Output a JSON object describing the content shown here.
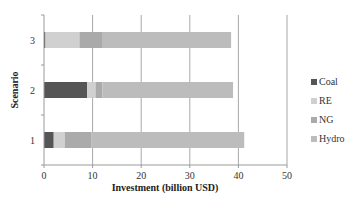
{
  "chart_data": {
    "type": "bar",
    "orientation": "horizontal",
    "stacked": true,
    "title": "",
    "xlabel": "Investment (billion USD)",
    "ylabel": "Scenario",
    "xlim": [
      0,
      50
    ],
    "xticks": [
      0,
      10,
      20,
      30,
      40,
      50
    ],
    "grid": "vertical",
    "categories": [
      "1",
      "2",
      "3"
    ],
    "series": [
      {
        "name": "Coal",
        "color": "#555555",
        "values": [
          2.0,
          8.9,
          0.3
        ]
      },
      {
        "name": "RE",
        "color": "#d0d0d0",
        "values": [
          2.3,
          1.7,
          7.0
        ]
      },
      {
        "name": "NG",
        "color": "#aaaaaa",
        "values": [
          5.5,
          1.4,
          4.8
        ]
      },
      {
        "name": "Hydro",
        "color": "#bcbcbc",
        "values": [
          31.4,
          26.9,
          26.4
        ]
      }
    ],
    "legend": {
      "placement": "right",
      "entries": [
        "Coal",
        "RE",
        "NG",
        "Hydro"
      ]
    }
  }
}
